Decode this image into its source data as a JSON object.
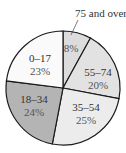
{
  "chart_data": {
    "type": "pie",
    "title": "",
    "start_angle_deg": 0,
    "direction": "clockwise",
    "slices": [
      {
        "label": "75 and over",
        "value": 8,
        "value_label": "8%",
        "color": "#dcdcdc"
      },
      {
        "label": "55–74",
        "value": 20,
        "value_label": "20%",
        "color": "#e2e2e2"
      },
      {
        "label": "35–54",
        "value": 25,
        "value_label": "25%",
        "color": "#ececec"
      },
      {
        "label": "18–34",
        "value": 24,
        "value_label": "24%",
        "color": "#b4b4b4"
      },
      {
        "label": "0–17",
        "value": 23,
        "value_label": "23%",
        "color": "#fafafa"
      }
    ],
    "annotations": [
      {
        "text": "75 and over",
        "points_to": "75 and over"
      }
    ]
  },
  "labels": {
    "callout": "75 and over",
    "s75_pct": "8%",
    "s55_name": "55–74",
    "s55_pct": "20%",
    "s35_name": "35–54",
    "s35_pct": "25%",
    "s18_name": "18–34",
    "s18_pct": "24%",
    "s0_name": "0–17",
    "s0_pct": "23%"
  }
}
